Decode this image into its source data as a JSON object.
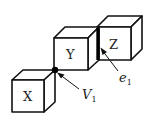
{
  "diagram": {
    "cubes": [
      {
        "id": "X",
        "label": "X"
      },
      {
        "id": "Y",
        "label": "Y"
      },
      {
        "id": "Z",
        "label": "Z"
      }
    ],
    "annotations": {
      "vertex": {
        "symbol": "V",
        "subscript": "1"
      },
      "edge": {
        "symbol": "e",
        "subscript": "1"
      }
    },
    "colors": {
      "stroke": "#111111",
      "background": "#ffffff"
    }
  }
}
